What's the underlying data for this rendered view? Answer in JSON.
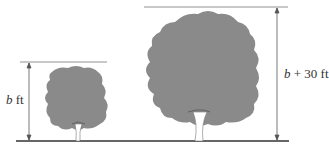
{
  "diagram": {
    "type": "height comparison of two trees",
    "colors": {
      "foliage": "#8a8a8a",
      "line": "#555555",
      "ground": "#333333",
      "trunk": "#ffffff"
    },
    "small_tree": {
      "label_var": "b",
      "label_unit": " ft",
      "label_full": "b ft"
    },
    "large_tree": {
      "label_var": "b",
      "label_rest": " + 30 ft",
      "label_full": "b + 30 ft"
    }
  }
}
